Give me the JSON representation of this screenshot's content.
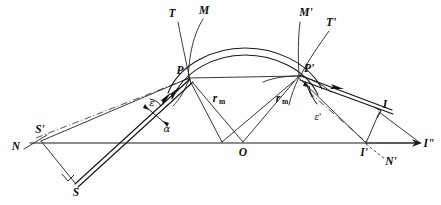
{
  "figure": {
    "background_color": "#ffffff",
    "ink_color": "#1a1a1a"
  },
  "points": [
    {
      "id": "N",
      "label": "N",
      "x": 16,
      "y": 147,
      "anchor": "middle"
    },
    {
      "id": "Sprime",
      "label": "S'",
      "x": 40,
      "y": 130,
      "anchor": "middle"
    },
    {
      "id": "S",
      "label": "S",
      "x": 76,
      "y": 192,
      "anchor": "middle"
    },
    {
      "id": "T",
      "label": "T",
      "x": 172,
      "y": 13,
      "anchor": "middle"
    },
    {
      "id": "M",
      "label": "M",
      "x": 203,
      "y": 10,
      "anchor": "middle"
    },
    {
      "id": "P",
      "label": "P",
      "x": 182,
      "y": 72,
      "anchor": "middle"
    },
    {
      "id": "Mprime",
      "label": "M'",
      "x": 306,
      "y": 12,
      "anchor": "middle"
    },
    {
      "id": "Tprime",
      "label": "T'",
      "x": 330,
      "y": 22,
      "anchor": "middle"
    },
    {
      "id": "Pprime",
      "label": "P'",
      "x": 306,
      "y": 70,
      "anchor": "middle"
    },
    {
      "id": "O",
      "label": "O",
      "x": 243,
      "y": 152,
      "anchor": "middle"
    },
    {
      "id": "I",
      "label": "I",
      "x": 384,
      "y": 105,
      "anchor": "middle"
    },
    {
      "id": "Iprime",
      "label": "I'",
      "x": 365,
      "y": 152,
      "anchor": "middle"
    },
    {
      "id": "Idouble",
      "label": "I\"",
      "x": 427,
      "y": 143,
      "anchor": "middle"
    },
    {
      "id": "Nprime",
      "label": "N'",
      "x": 390,
      "y": 161,
      "anchor": "middle"
    }
  ],
  "angle_labels": [
    {
      "id": "epsilon",
      "label": "ε",
      "x": 153,
      "y": 104
    },
    {
      "id": "alpha",
      "label": "α",
      "x": 167,
      "y": 129
    },
    {
      "id": "epsilon_prime",
      "label": "ε'",
      "x": 318,
      "y": 117
    }
  ],
  "radius_labels": [
    {
      "id": "rm_left",
      "base": "r",
      "sub": "m",
      "x": 219,
      "y": 99
    },
    {
      "id": "rm_right",
      "base": "r",
      "sub": "m",
      "x": 282,
      "y": 99
    }
  ],
  "geometry": {
    "baseline": {
      "x1": 30,
      "y1": 143,
      "x2": 422,
      "y2": 143,
      "arrow_at": "right"
    },
    "vertex_O": {
      "x": 243,
      "y": 143
    },
    "point_P": {
      "x": 189,
      "y": 78
    },
    "point_P_prime": {
      "x": 298,
      "y": 76
    },
    "point_S": {
      "x": 74,
      "y": 183
    },
    "point_S_prime": {
      "x": 41,
      "y": 141
    },
    "point_I": {
      "x": 379,
      "y": 113
    },
    "point_I_prime": {
      "x": 365,
      "y": 143
    },
    "point_I_double": {
      "x": 420,
      "y": 143
    },
    "arc_band_count": 2,
    "line_style_normal": "dash-dot",
    "line_style_auxiliary": "dashed"
  }
}
